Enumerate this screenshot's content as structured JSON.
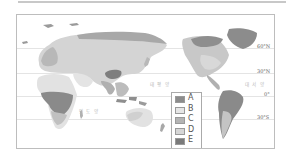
{
  "map": {
    "type": "world climate/vegetation zone map (Pacific-centered)",
    "latitude_labels": [
      {
        "label": "60°N",
        "y": 33
      },
      {
        "label": "30°N",
        "y": 58
      },
      {
        "label": "0°",
        "y": 81
      },
      {
        "label": "30°S",
        "y": 104
      }
    ],
    "ocean_labels": [
      {
        "label": "태 평 양",
        "x": 133,
        "y": 66
      },
      {
        "label": "대 서 양",
        "x": 228,
        "y": 66
      },
      {
        "label": "인 도 양",
        "x": 62,
        "y": 93
      }
    ]
  },
  "legend": {
    "items": [
      {
        "label": "A",
        "color": "#8c8c8c"
      },
      {
        "label": "B",
        "color": "#e6e6e6"
      },
      {
        "label": "C",
        "color": "#b4b4b4"
      },
      {
        "label": "D",
        "color": "#d6d6d6"
      },
      {
        "label": "E",
        "color": "#7a7a7a"
      }
    ]
  },
  "colors": {
    "frame": "#bdbdbd",
    "land_light": "#dcdcdc",
    "land_mid": "#bdbdbd",
    "land_dark": "#8c8c8c"
  }
}
